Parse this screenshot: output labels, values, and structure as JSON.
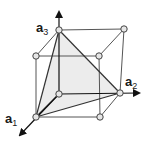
{
  "diagram": {
    "type": "cubic lattice unit cell with shaded tetrahedral plane",
    "colors": {
      "line": "#555555",
      "node_fill": "#e6e6e6",
      "node_stroke": "#444444",
      "shade": "#e9e9e9",
      "axis": "#111111"
    },
    "axes": [
      {
        "name": "a",
        "sub": "1",
        "label": "a1"
      },
      {
        "name": "a",
        "sub": "2",
        "label": "a2"
      },
      {
        "name": "a",
        "sub": "3",
        "label": "a3"
      }
    ],
    "nodes": [
      {
        "id": "origin",
        "x": 59,
        "y": 94
      },
      {
        "id": "a1",
        "x": 36,
        "y": 117
      },
      {
        "id": "a2",
        "x": 120,
        "y": 93
      },
      {
        "id": "a3",
        "x": 59,
        "y": 30
      },
      {
        "id": "a1a2",
        "x": 100,
        "y": 117
      },
      {
        "id": "a1a3",
        "x": 36,
        "y": 56
      },
      {
        "id": "a2a3",
        "x": 124,
        "y": 29
      },
      {
        "id": "a1a2a3",
        "x": 99,
        "y": 56
      }
    ]
  }
}
